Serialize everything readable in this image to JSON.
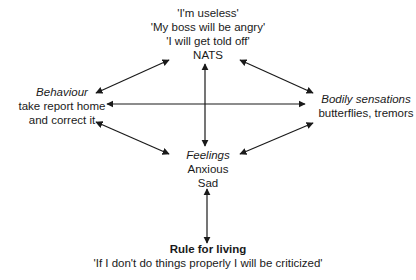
{
  "diagram": {
    "type": "cognitive-model",
    "nodes": {
      "nats": {
        "lines": [
          "'I'm useless'",
          "'My boss will be angry'",
          "'I will get told off'"
        ],
        "label": "NATS"
      },
      "behaviour": {
        "heading": "Behaviour",
        "lines": [
          "take report home",
          "and correct it"
        ]
      },
      "bodily": {
        "heading": "Bodily sensations",
        "lines": [
          "butterflies, tremors"
        ]
      },
      "feelings": {
        "heading": "Feelings",
        "lines": [
          "Anxious",
          "Sad"
        ]
      },
      "rule": {
        "heading": "Rule for living",
        "lines": [
          "'If I don't do things properly I will be criticized'"
        ]
      }
    },
    "edges": [
      {
        "from": "nats",
        "to": "feelings",
        "bidirectional": true
      },
      {
        "from": "behaviour",
        "to": "bodily",
        "bidirectional": true
      },
      {
        "from": "behaviour",
        "to": "nats",
        "bidirectional": true
      },
      {
        "from": "nats",
        "to": "bodily",
        "bidirectional": true
      },
      {
        "from": "behaviour",
        "to": "feelings",
        "bidirectional": true
      },
      {
        "from": "feelings",
        "to": "bodily",
        "bidirectional": true
      },
      {
        "from": "feelings",
        "to": "rule",
        "bidirectional": true
      }
    ],
    "colors": {
      "line": "#1a1a1a",
      "background": "#ffffff"
    }
  }
}
